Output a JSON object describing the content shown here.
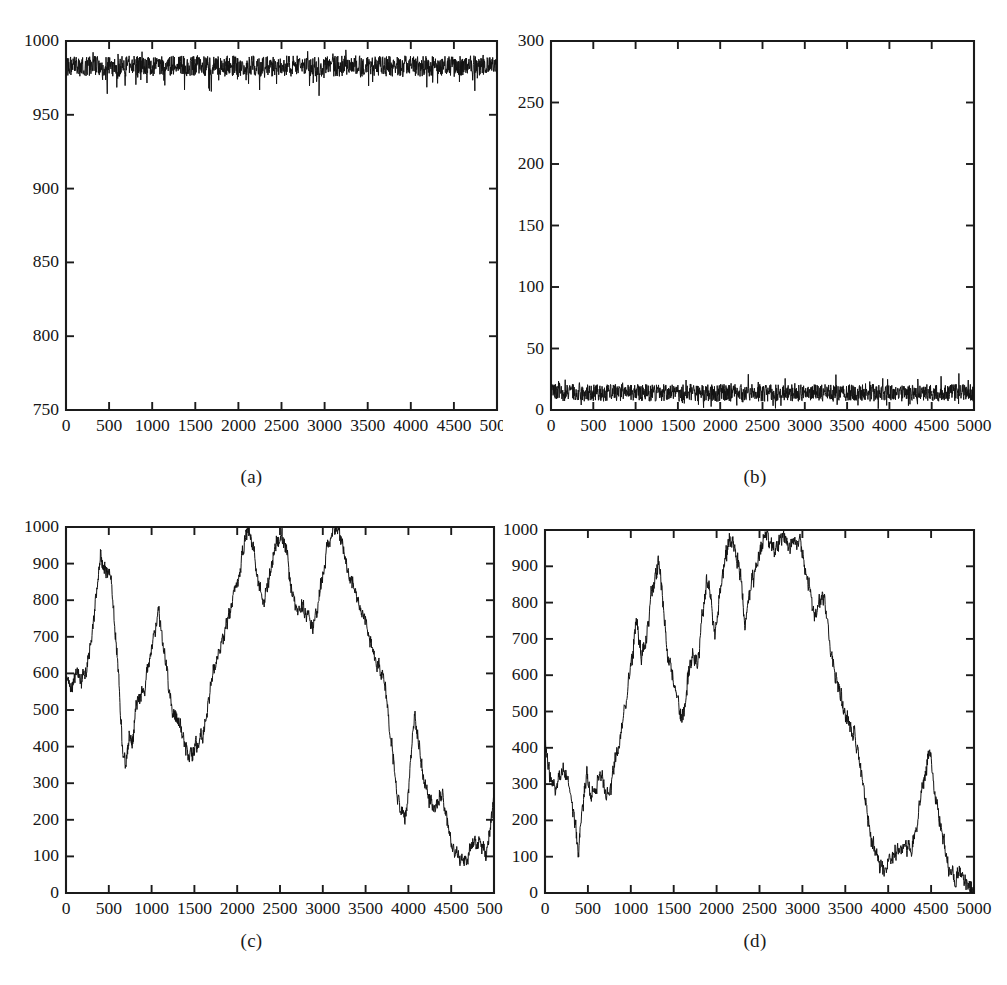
{
  "figure": {
    "panel_labels": [
      "(a)",
      "(b)",
      "(c)",
      "(d)"
    ],
    "line_color": "#121212",
    "axis_color": "#1b1b1b",
    "background": "#ffffff"
  },
  "chart_data": [
    {
      "type": "line",
      "panel": "(a)",
      "title": "",
      "xlabel": "",
      "ylabel": "",
      "xlim": [
        0,
        5000
      ],
      "ylim": [
        750,
        1000
      ],
      "xticks": [
        0,
        500,
        1000,
        1500,
        2000,
        2500,
        3000,
        3500,
        4000,
        4500,
        5000
      ],
      "yticks": [
        750,
        800,
        850,
        900,
        950,
        1000
      ],
      "xtick_labels": [
        "0",
        "500",
        "1000",
        "1500",
        "2000",
        "2500",
        "3000",
        "3500",
        "4000",
        "4500",
        "5000"
      ],
      "ytick_labels": [
        "750",
        "800",
        "850",
        "900",
        "950",
        "1000"
      ],
      "grid": false,
      "legend": null,
      "description": "dense high-frequency noise band near the top of the axis",
      "noise_band": {
        "center": 983,
        "half_width": 7,
        "spike_down": 15,
        "spike_up": 6,
        "samples": 1400,
        "seed": 11
      }
    },
    {
      "type": "line",
      "panel": "(b)",
      "title": "",
      "xlabel": "",
      "ylabel": "",
      "xlim": [
        0,
        5000
      ],
      "ylim": [
        0,
        300
      ],
      "xticks": [
        0,
        500,
        1000,
        1500,
        2000,
        2500,
        3000,
        3500,
        4000,
        4500,
        5000
      ],
      "yticks": [
        0,
        50,
        100,
        150,
        200,
        250,
        300
      ],
      "xtick_labels": [
        "0",
        "500",
        "1000",
        "1500",
        "2000",
        "2500",
        "3000",
        "3500",
        "4000",
        "4500",
        "5000"
      ],
      "ytick_labels": [
        "0",
        "50",
        "100",
        "150",
        "200",
        "250",
        "300"
      ],
      "grid": false,
      "legend": null,
      "description": "dense high-frequency noise band near the bottom of the axis",
      "noise_band": {
        "center": 14,
        "half_width": 7,
        "spike_down": 9,
        "spike_up": 10,
        "samples": 1400,
        "seed": 29
      }
    },
    {
      "type": "line",
      "panel": "(c)",
      "title": "",
      "xlabel": "",
      "ylabel": "",
      "xlim": [
        0,
        5000
      ],
      "ylim": [
        0,
        1000
      ],
      "xticks": [
        0,
        500,
        1000,
        1500,
        2000,
        2500,
        3000,
        3500,
        4000,
        4500,
        5000
      ],
      "yticks": [
        0,
        100,
        200,
        300,
        400,
        500,
        600,
        700,
        800,
        900,
        1000
      ],
      "xtick_labels": [
        "0",
        "500",
        "1000",
        "1500",
        "2000",
        "2500",
        "3000",
        "3500",
        "4000",
        "4500",
        "5000"
      ],
      "ytick_labels": [
        "0",
        "100",
        "200",
        "300",
        "400",
        "500",
        "600",
        "700",
        "800",
        "900",
        "1000"
      ],
      "grid": false,
      "legend": null,
      "description": "slowly wandering noisy series: starts near 600, peaks ~930 at 450, dips ~350 at 700, secondary peak ~770 at 1080, trough ~360 at 1450, broad rise to 1000 near 2100-3150, steep fall to ~200 at 3850, bump ~490 at 4000, minimum ~85 near 4500, recovery to ~290 at 5000",
      "x": [
        0,
        60,
        120,
        180,
        240,
        300,
        360,
        400,
        440,
        470,
        520,
        580,
        620,
        660,
        700,
        740,
        780,
        820,
        870,
        920,
        980,
        1020,
        1080,
        1130,
        1180,
        1240,
        1290,
        1340,
        1400,
        1460,
        1500,
        1550,
        1600,
        1660,
        1720,
        1780,
        1840,
        1900,
        1960,
        2020,
        2080,
        2130,
        2180,
        2240,
        2300,
        2360,
        2420,
        2470,
        2520,
        2580,
        2640,
        2700,
        2760,
        2820,
        2880,
        2940,
        3000,
        3060,
        3120,
        3180,
        3240,
        3300,
        3360,
        3420,
        3480,
        3540,
        3600,
        3660,
        3720,
        3780,
        3840,
        3900,
        3960,
        4010,
        4070,
        4130,
        4190,
        4250,
        4310,
        4370,
        4430,
        4490,
        4550,
        4610,
        4670,
        4730,
        4790,
        4850,
        4910,
        4960,
        5000
      ],
      "y": [
        600,
        560,
        610,
        575,
        600,
        700,
        830,
        930,
        900,
        880,
        880,
        700,
        560,
        400,
        345,
        430,
        400,
        530,
        540,
        560,
        640,
        700,
        770,
        680,
        600,
        500,
        470,
        450,
        400,
        370,
        400,
        420,
        440,
        510,
        600,
        660,
        690,
        760,
        820,
        870,
        950,
        1000,
        960,
        870,
        790,
        840,
        930,
        960,
        975,
        930,
        820,
        760,
        780,
        760,
        720,
        780,
        870,
        950,
        1000,
        990,
        940,
        860,
        840,
        790,
        760,
        700,
        650,
        610,
        580,
        460,
        330,
        230,
        200,
        300,
        490,
        400,
        300,
        250,
        230,
        270,
        240,
        150,
        110,
        90,
        85,
        130,
        140,
        120,
        110,
        190,
        270,
        290
      ],
      "sub_noise": {
        "amplitude": 28,
        "samples_per_segment": 16,
        "seed": 7
      }
    },
    {
      "type": "line",
      "panel": "(d)",
      "title": "",
      "xlabel": "",
      "ylabel": "",
      "xlim": [
        0,
        5000
      ],
      "ylim": [
        0,
        1000
      ],
      "xticks": [
        0,
        500,
        1000,
        1500,
        2000,
        2500,
        3000,
        3500,
        4000,
        4500,
        5000
      ],
      "yticks": [
        0,
        100,
        200,
        300,
        400,
        500,
        600,
        700,
        800,
        900,
        1000
      ],
      "xtick_labels": [
        "0",
        "500",
        "1000",
        "1500",
        "2000",
        "2500",
        "3000",
        "3500",
        "4000",
        "4500",
        "5000"
      ],
      "ytick_labels": [
        "0",
        "100",
        "200",
        "300",
        "400",
        "500",
        "600",
        "700",
        "800",
        "900",
        "1000"
      ],
      "grid": false,
      "legend": null,
      "description": "slowly wandering noisy series: starts ~420, falls to ~110 at 400, meanders 250-350 until 800, climbs to ~910 at 1320, dips ~480 at 1620, rises to plateau ~970 from 2100 to 3000, steep fall, ~500 bump at 3500, minimum ~60 near 3950-4250, bump ~390 at 4470, ends near 0 at 5000",
      "x": [
        0,
        50,
        100,
        160,
        220,
        280,
        340,
        390,
        440,
        490,
        540,
        600,
        660,
        720,
        780,
        840,
        900,
        960,
        1020,
        1070,
        1120,
        1180,
        1240,
        1290,
        1330,
        1380,
        1430,
        1480,
        1530,
        1580,
        1620,
        1670,
        1720,
        1780,
        1830,
        1880,
        1930,
        1980,
        2030,
        2080,
        2130,
        2180,
        2230,
        2280,
        2330,
        2390,
        2450,
        2510,
        2570,
        2620,
        2680,
        2740,
        2800,
        2860,
        2920,
        2980,
        3030,
        3080,
        3140,
        3200,
        3250,
        3310,
        3370,
        3430,
        3490,
        3540,
        3600,
        3660,
        3720,
        3780,
        3840,
        3900,
        3960,
        4020,
        4080,
        4140,
        4200,
        4260,
        4320,
        4380,
        4440,
        4480,
        4540,
        4600,
        4660,
        4720,
        4780,
        4840,
        4900,
        4960,
        5000
      ],
      "y": [
        420,
        330,
        290,
        310,
        350,
        290,
        220,
        110,
        250,
        330,
        270,
        290,
        330,
        260,
        310,
        380,
        470,
        560,
        660,
        760,
        650,
        700,
        820,
        880,
        910,
        790,
        650,
        610,
        560,
        480,
        500,
        600,
        660,
        620,
        760,
        860,
        820,
        700,
        820,
        900,
        960,
        980,
        930,
        880,
        730,
        830,
        890,
        940,
        990,
        960,
        940,
        970,
        980,
        960,
        980,
        960,
        900,
        840,
        760,
        800,
        820,
        700,
        620,
        560,
        500,
        470,
        430,
        380,
        280,
        180,
        120,
        80,
        65,
        90,
        110,
        130,
        140,
        110,
        160,
        260,
        340,
        390,
        290,
        200,
        120,
        60,
        45,
        60,
        40,
        20,
        0
      ],
      "sub_noise": {
        "amplitude": 30,
        "samples_per_segment": 16,
        "seed": 17
      }
    }
  ]
}
